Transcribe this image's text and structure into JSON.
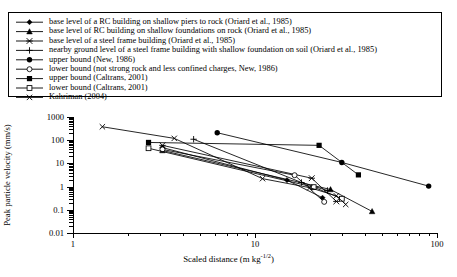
{
  "legend": {
    "items": [
      {
        "marker": "diamond-filled",
        "label": "base level of a RC building on shallow piers to rock (Oriard et al., 1985)"
      },
      {
        "marker": "triangle-filled",
        "label": "base level of RC building on shallow foundations on rock (Oriard et al., 1985)"
      },
      {
        "marker": "asterisk",
        "label": "base level of a steel frame building (Oriard et al., 1985)"
      },
      {
        "marker": "plus",
        "label": "nearby ground level of a steel frame building with shallow foundation on soil (Oriard et al., 1985)"
      },
      {
        "marker": "circle-filled",
        "label": "upper bound (New, 1986)"
      },
      {
        "marker": "circle-open",
        "label": "lower bound (not strong rock and less confined charges, New, 1986)"
      },
      {
        "marker": "square-filled",
        "label": "upper bound (Caltrans, 2001)"
      },
      {
        "marker": "square-open",
        "label": "lower bound (Caltrans, 2001)"
      },
      {
        "marker": "cross",
        "label": "Kahriman (2004)"
      }
    ]
  },
  "chart_data": {
    "type": "line",
    "title": "",
    "xlabel": "Scaled distance (m kg",
    "xlabel_sup": "-1/2",
    "xlabel_tail": ")",
    "ylabel": "Peak particle velocity (mm/s)",
    "xscale": "log",
    "yscale": "log",
    "xlim": [
      1,
      100
    ],
    "ylim": [
      0.01,
      1000
    ],
    "xticks": [
      1,
      10,
      100
    ],
    "xticklabels": [
      "1",
      "10",
      "100"
    ],
    "yticks": [
      0.01,
      0.1,
      1,
      10,
      100,
      1000
    ],
    "yticklabels": [
      "0.01",
      "0.1",
      "1",
      "10",
      "100",
      "1000"
    ],
    "grid": false,
    "legend_position": "above-plot",
    "series": [
      {
        "name": "base level of a RC building on shallow piers to rock (Oriard et al., 1985)",
        "marker": "diamond-filled",
        "points": [
          [
            3.1,
            48
          ],
          [
            15.0,
            1.9
          ],
          [
            23.5,
            0.33
          ]
        ]
      },
      {
        "name": "base level of RC building on shallow foundations on rock (Oriard et al., 1985)",
        "marker": "triangle-filled",
        "points": [
          [
            3.1,
            36
          ],
          [
            26.0,
            0.75
          ],
          [
            44.0,
            0.085
          ]
        ]
      },
      {
        "name": "base level of a steel frame building (Oriard et al., 1985)",
        "marker": "asterisk",
        "points": [
          [
            3.1,
            60
          ],
          [
            20.5,
            2.3
          ],
          [
            28.0,
            0.23
          ]
        ]
      },
      {
        "name": "nearby ground level of a steel frame building with shallow foundation on soil (Oriard et al., 1985)",
        "marker": "plus",
        "points": [
          [
            4.6,
            110
          ],
          [
            18.0,
            1.5
          ],
          [
            25.0,
            0.68
          ]
        ]
      },
      {
        "name": "upper bound (New, 1986)",
        "marker": "circle-filled",
        "points": [
          [
            6.2,
            210
          ],
          [
            30.0,
            11.0
          ],
          [
            90.0,
            1.05
          ]
        ]
      },
      {
        "name": "lower bound (not strong rock and less confined charges, New, 1986)",
        "marker": "circle-open",
        "points": [
          [
            3.1,
            40
          ],
          [
            16.5,
            3.1
          ],
          [
            24.0,
            0.22
          ]
        ]
      },
      {
        "name": "upper bound (Caltrans, 2001)",
        "marker": "square-filled",
        "points": [
          [
            2.6,
            80
          ],
          [
            22.5,
            60.0
          ],
          [
            37.0,
            3.2
          ]
        ]
      },
      {
        "name": "lower bound (Caltrans, 2001)",
        "marker": "square-open",
        "points": [
          [
            2.6,
            45
          ],
          [
            21.0,
            0.95
          ],
          [
            30.0,
            0.3
          ]
        ]
      },
      {
        "name": "Kahriman (2004)",
        "marker": "cross",
        "points": [
          [
            1.45,
            380
          ],
          [
            3.6,
            120
          ],
          [
            11.0,
            2.2
          ],
          [
            20.0,
            0.9
          ],
          [
            28.0,
            0.4
          ],
          [
            31.5,
            0.17
          ]
        ]
      }
    ]
  }
}
